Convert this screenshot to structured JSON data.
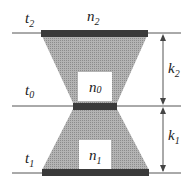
{
  "diagram": {
    "colors": {
      "line": "#555555",
      "bar": "#3a3a3a",
      "fill": "#a8a8a8",
      "box": "#ffffff",
      "text": "#222222"
    },
    "levels": [
      {
        "id": "t2",
        "base": "t",
        "sub": "2"
      },
      {
        "id": "t0",
        "base": "t",
        "sub": "0"
      },
      {
        "id": "t1",
        "base": "t",
        "sub": "1"
      }
    ],
    "nodes": [
      {
        "id": "n2",
        "base": "n",
        "sub": "2"
      },
      {
        "id": "n0",
        "base": "n",
        "sub": "0"
      },
      {
        "id": "n1",
        "base": "n",
        "sub": "1"
      }
    ],
    "dimensions": [
      {
        "id": "k2",
        "base": "k",
        "sub": "2"
      },
      {
        "id": "k1",
        "base": "k",
        "sub": "1"
      }
    ]
  }
}
